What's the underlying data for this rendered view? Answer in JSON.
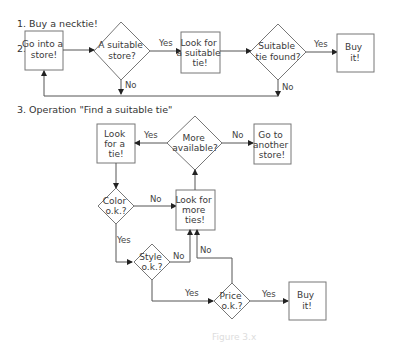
{
  "sections": {
    "s1": "1.  Buy a necktie!",
    "s2_num": "2.",
    "s3": "3. Operation \"Find a suitable tie\""
  },
  "flow1": {
    "go_store": [
      "Go into a",
      "store!"
    ],
    "suitable_store": [
      "A suitable",
      "store?"
    ],
    "look_suitable": [
      "Look for",
      "a suitable",
      "tie!"
    ],
    "tie_found": [
      "Suitable",
      "tie found?"
    ],
    "buy": [
      "Buy",
      "it!"
    ],
    "edges": {
      "yes1": "Yes",
      "no1": "No",
      "yes2": "Yes",
      "no2": "No"
    }
  },
  "flow2": {
    "look_tie": [
      "Look",
      "for a",
      "tie!"
    ],
    "more_available": [
      "More",
      "available?"
    ],
    "another_store": [
      "Go to",
      "another",
      "store!"
    ],
    "color_ok": [
      "Color",
      "o.k.?"
    ],
    "look_more": [
      "Look for",
      "more",
      "ties!"
    ],
    "style_ok": [
      "Style",
      "o.k.?"
    ],
    "price_ok": [
      "Price",
      "o.k.?"
    ],
    "buy": [
      "Buy",
      "it!"
    ],
    "edges": {
      "more_yes": "Yes",
      "more_no": "No",
      "color_no": "No",
      "color_yes": "Yes",
      "style_no": "No",
      "style_yes": "Yes",
      "price_no": "No",
      "price_yes": "Yes"
    }
  },
  "caption": "Figure 3.x"
}
